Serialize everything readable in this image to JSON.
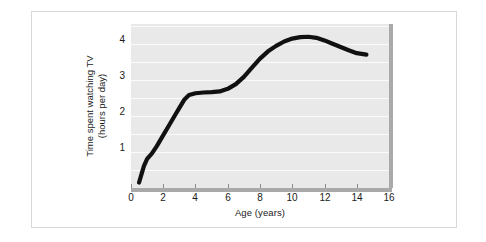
{
  "figure": {
    "background_color": "#ffffff",
    "frame_color": "#d8d8d8",
    "plot_background_color": "#e9e9e9",
    "gridline_color": "#fbfbfb",
    "axis_color": "#a9a9a9",
    "curve_color": "#111111"
  },
  "chart_data": {
    "type": "line",
    "title": "",
    "subtitle": "",
    "xlabel": "Age (years)",
    "ylabel": "Time spent watching TV (hours per day)",
    "ylabel_line1": "Time spent watching TV",
    "ylabel_line2": "(hours per day)",
    "xlim": [
      0,
      16
    ],
    "ylim": [
      0,
      4.5
    ],
    "xticks": [
      0,
      2,
      4,
      6,
      8,
      10,
      12,
      14,
      16
    ],
    "xtick_labels": [
      "0",
      "2",
      "4",
      "6",
      "8",
      "10",
      "12",
      "14",
      "16"
    ],
    "yticks": [
      1,
      2,
      3,
      4
    ],
    "ytick_labels": [
      "1",
      "2",
      "3",
      "4"
    ],
    "grid": true,
    "grid_axis": "y",
    "gridline_values": [
      0.5,
      1.0,
      1.5,
      2.0,
      2.5,
      3.0,
      3.5,
      4.0,
      4.5
    ],
    "legend": null,
    "legend_position": "none",
    "series": [
      {
        "name": "Time spent watching TV",
        "x": [
          0.5,
          0.8,
          1.0,
          1.3,
          1.6,
          2.0,
          2.4,
          2.8,
          3.0,
          3.3,
          3.6,
          4.0,
          4.5,
          5.0,
          5.5,
          6.0,
          6.5,
          7.0,
          7.5,
          8.0,
          8.5,
          9.0,
          9.5,
          10.0,
          10.5,
          11.0,
          11.5,
          12.0,
          12.5,
          13.0,
          13.5,
          14.0,
          14.6
        ],
        "y": [
          0.15,
          0.6,
          0.8,
          0.95,
          1.15,
          1.45,
          1.75,
          2.05,
          2.2,
          2.42,
          2.55,
          2.6,
          2.62,
          2.63,
          2.65,
          2.72,
          2.85,
          3.05,
          3.3,
          3.55,
          3.75,
          3.9,
          4.02,
          4.1,
          4.14,
          4.15,
          4.12,
          4.05,
          3.96,
          3.87,
          3.78,
          3.7,
          3.66
        ]
      }
    ]
  }
}
